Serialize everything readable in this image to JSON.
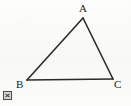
{
  "figure": {
    "kind": "geometry-diagram",
    "shape_name": "triangle",
    "width": 131,
    "height": 106,
    "background_color": "#fbfbfa",
    "stroke_color": "#2b2b2b",
    "stroke_width": 1.6,
    "label_color": "#232323"
  },
  "labels": {
    "apex": "A",
    "bottom_left": "B",
    "bottom_right": "C"
  },
  "vertices": [
    {
      "name": "A",
      "x": 83,
      "y": 18
    },
    {
      "name": "B",
      "x": 27,
      "y": 80
    },
    {
      "name": "C",
      "x": 113,
      "y": 79
    }
  ],
  "edges": [
    {
      "name": "AB",
      "from": "A",
      "to": "B"
    },
    {
      "name": "BC",
      "from": "B",
      "to": "C"
    },
    {
      "name": "CA",
      "from": "C",
      "to": "A"
    }
  ],
  "icons": {
    "broken_image": "broken-image-icon"
  }
}
